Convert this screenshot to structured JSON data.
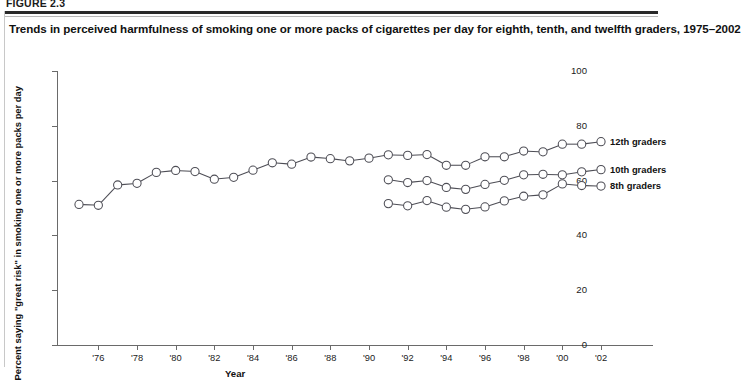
{
  "figure": {
    "label": "FIGURE 2.3",
    "title": "Trends in perceived harmfulness of smoking one or more packs of cigarettes per day for eighth, tenth, and twelfth graders, 1975–2002"
  },
  "chart_data": {
    "type": "line",
    "title": "Trends in perceived harmfulness of smoking one or more packs of cigarettes per day for eighth, tenth, and twelfth graders, 1975–2002",
    "xlabel": "Year",
    "ylabel": "Percent saying \"great risk\" in smoking one or more packs per day",
    "xlim": [
      1975,
      2002
    ],
    "ylim": [
      0,
      100
    ],
    "grid": false,
    "legend_position": "right-end-of-line",
    "y_ticks": [
      0,
      20,
      40,
      60,
      80,
      100
    ],
    "x_ticks": [
      1976,
      1978,
      1980,
      1982,
      1984,
      1986,
      1988,
      1990,
      1992,
      1994,
      1996,
      1998,
      2000,
      2002
    ],
    "x_tick_labels": [
      "'76",
      "'78",
      "'80",
      "'82",
      "'84",
      "'86",
      "'88",
      "'90",
      "'92",
      "'94",
      "'96",
      "'98",
      "'00",
      "'02"
    ],
    "marker": "open-circle",
    "series": [
      {
        "name": "12th graders",
        "x": [
          1975,
          1976,
          1977,
          1978,
          1979,
          1980,
          1981,
          1982,
          1983,
          1984,
          1985,
          1986,
          1987,
          1988,
          1989,
          1990,
          1991,
          1992,
          1993,
          1994,
          1995,
          1996,
          1997,
          1998,
          1999,
          2000,
          2001,
          2002
        ],
        "values": [
          51.3,
          51.0,
          58.4,
          59.0,
          63.0,
          63.7,
          63.3,
          60.5,
          61.2,
          63.8,
          66.5,
          66.0,
          68.6,
          68.0,
          67.2,
          68.2,
          69.4,
          69.2,
          69.5,
          65.6,
          65.6,
          68.7,
          68.7,
          70.8,
          70.5,
          73.3,
          73.3,
          74.2
        ]
      },
      {
        "name": "10th graders",
        "x": [
          1991,
          1992,
          1993,
          1994,
          1995,
          1996,
          1997,
          1998,
          1999,
          2000,
          2001,
          2002
        ],
        "values": [
          60.3,
          59.3,
          60.0,
          57.5,
          56.8,
          58.6,
          60.1,
          62.1,
          62.3,
          62.1,
          63.2,
          64.0
        ]
      },
      {
        "name": "8th graders",
        "x": [
          1991,
          1992,
          1993,
          1994,
          1995,
          1996,
          1997,
          1998,
          1999,
          2000,
          2001,
          2002
        ],
        "values": [
          51.6,
          50.8,
          52.7,
          50.3,
          49.5,
          50.4,
          52.6,
          54.3,
          54.8,
          58.8,
          58.2,
          58.0
        ]
      }
    ]
  },
  "legend": {
    "items": [
      {
        "label": "12th graders"
      },
      {
        "label": "10th graders"
      },
      {
        "label": "8th graders"
      }
    ]
  },
  "colors": {
    "line": "#4d4d55",
    "marker_fill": "#ffffff",
    "axis": "#6a6a6a",
    "text": "#111111",
    "rule": "#2a2a2a"
  }
}
